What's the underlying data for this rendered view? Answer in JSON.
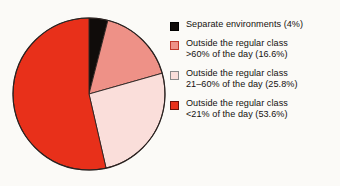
{
  "chart_data": {
    "type": "pie",
    "title": "",
    "start_angle_deg": 0,
    "direction": "clockwise",
    "categories": [
      "Separate environments",
      "Outside the regular class >60% of the day",
      "Outside the regular class 21–60% of the day",
      "Outside the regular class <21% of the day"
    ],
    "values": [
      4.0,
      16.6,
      25.8,
      53.6
    ],
    "value_unit": "percent",
    "colors": [
      "#100c0a",
      "#ee9187",
      "#fadeda",
      "#e8301a"
    ],
    "legend_position": "right",
    "grid": false
  },
  "legend": {
    "items": [
      {
        "label": "Separate environments (4%)",
        "line1": "Separate environments (4%)",
        "line2": "",
        "percent": "4%",
        "swatch_color": "#100c0a",
        "swatch_border": "#000000",
        "swatch_name": "legend-swatch-separate-environments"
      },
      {
        "label": "Outside the regular class\n>60% of the day  (16.6%)",
        "line1": "Outside the regular class",
        "line2": ">60% of the day  (16.6%)",
        "percent": "16.6%",
        "swatch_color": "#ee9187",
        "swatch_border": "#c0392b",
        "swatch_name": "legend-swatch-outside-over-60"
      },
      {
        "label": "Outside the regular class\n21–60% of the day  (25.8%)",
        "line1": "Outside the regular class",
        "line2": "21–60% of the day  (25.8%)",
        "percent": "25.8%",
        "swatch_color": "#fadeda",
        "swatch_border": "#8a8a8a",
        "swatch_name": "legend-swatch-outside-21-60"
      },
      {
        "label": "Outside the regular class\n<21% of the day  (53.6%)",
        "line1": "Outside the regular class",
        "line2": "<21% of the day  (53.6%)",
        "percent": "53.6%",
        "swatch_color": "#e8301a",
        "swatch_border": "#6b1008",
        "swatch_name": "legend-swatch-outside-under-21"
      }
    ]
  },
  "style": {
    "background": "#fbfaf7",
    "outline": "#2b2220",
    "text_color": "#15110f"
  }
}
